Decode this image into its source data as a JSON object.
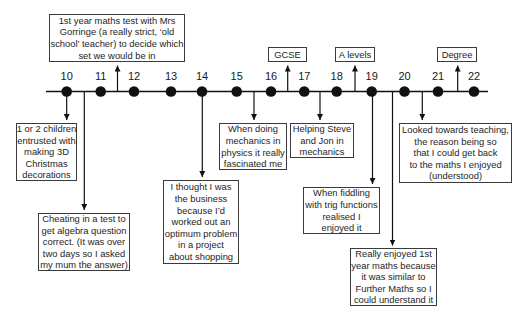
{
  "timeline": {
    "ages": [
      "10",
      "11",
      "12",
      "13",
      "14",
      "15",
      "16",
      "17",
      "18",
      "19",
      "20",
      "21",
      "22"
    ]
  },
  "milestones": {
    "gcse": "GCSE",
    "a_levels": "A levels",
    "degree": "Degree"
  },
  "events_above": {
    "maths_test": "1st year maths test with Mrs\nGorringe (a really strict, ‘old\nschool’ teacher) to decide which\nset we would be in"
  },
  "events_below": {
    "christmas_decorations": "1 or 2 children\nentrusted with\nmaking 3D\nChristmas\ndecorations",
    "cheating_test": "Cheating in a test to\nget algebra question\ncorrect. (It was over\ntwo days so I asked\nmy mum the answer)",
    "optimum_problem": "I thought I was\nthe business\nbecause I’d\nworked out an\noptimum problem\nin a project\nabout shopping",
    "mechanics_physics": "When doing\nmechanics in\nphysics it really\nfascinated me",
    "helping_steve_jon": "Helping Steve\nand Jon in\nmechanics",
    "trig_functions": "When fiddling\nwith trig functions\nrealised I\nenjoyed it",
    "first_year_maths": "Really enjoyed 1st\nyear maths because\nit was similar to\nFurther Maths so I\ncould understand it",
    "teaching": "Looked towards teaching,\nthe reason being so\nthat I could get back\nto the maths I enjoyed\n(understood)"
  },
  "colors": {
    "line": "#111111",
    "border": "#3a3a3a",
    "text": "#1e1e1e",
    "background": "#ffffff"
  }
}
